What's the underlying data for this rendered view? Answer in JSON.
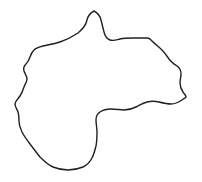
{
  "figure": {
    "name": "region-outline-map",
    "type": "outline-map",
    "title": "",
    "caption": "",
    "background_color": "#ffffff",
    "stroke_color": "#231f20",
    "fill_color": "#ffffff",
    "stroke_width": 1.4,
    "canvas": {
      "width": 202,
      "height": 182
    },
    "shape": {
      "label": "",
      "bounds": {
        "x_min": 15,
        "y_min": 11,
        "x_max": 187,
        "y_max": 170
      },
      "extreme_points": {
        "north_peak": [
          94,
          11
        ],
        "east_point": [
          186,
          97
        ],
        "west_point": [
          15,
          104
        ],
        "south_point": [
          73,
          170
        ]
      },
      "path": "M 94 11 C 90 13 88 16 87 20 C 86 25 83 29 78 33 C 72 37 66 40 60 42 C 54 44 48 45 43 46 C 39 47 36 48 34 50 C 32 52 31 54 30 57 C 29 60 28 62 26 64 C 24 66 23 68 24 71 C 25 74 27 76 27 79 C 27 82 25 84 24 87 C 23 90 22 93 20 96 C 18 99 15 101 15 104 C 15 107 17 109 18 112 C 19 115 19 118 19 121 C 19 125 20 128 22 132 C 24 136 27 140 30 144 C 33 148 36 152 40 157 C 44 161 48 165 53 167 C 58 169 63 170 68 170 C 73 170 78 169 83 167 C 87 165 90 162 92 158 C 94 154 95 150 96 146 C 97 141 97 137 97 132 C 97 128 96 124 96 120 C 96 117 97 114 100 112 C 103 110 107 109 111 109 C 116 109 120 110 124 110 C 128 110 132 109 136 107 C 140 105 143 103 147 102 C 151 101 155 101 159 102 C 163 103 167 104 171 104 C 175 104 179 102 182 100 C 184 98 186 98 186 97 C 186 95 184 94 183 92 C 181 89 180 86 180 83 C 180 80 181 77 181 74 C 181 71 180 68 177 66 C 174 64 171 62 169 59 C 167 56 165 53 162 50 C 159 47 155 44 152 41 C 150 39 149 38 148 38 C 144 38 139 38 134 38 C 129 38 124 38 120 39 C 116 40 113 41 110 40 C 107 39 105 36 104 32 C 103 28 102 24 101 20 C 100 16 98 13 94 11 Z"
    }
  }
}
